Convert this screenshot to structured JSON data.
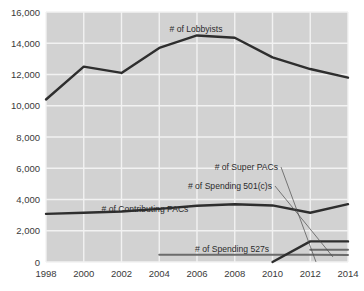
{
  "chart_data": {
    "type": "line",
    "title": "",
    "xlabel": "",
    "ylabel": "",
    "xlim": [
      1998,
      2014
    ],
    "ylim": [
      0,
      16000
    ],
    "grid": true,
    "legend_position": "inline-annotations",
    "x": [
      1998,
      2000,
      2002,
      2004,
      2006,
      2008,
      2010,
      2012,
      2014
    ],
    "x_tick_labels": [
      "1998",
      "2000",
      "2002",
      "2004",
      "2006",
      "2008",
      "2010",
      "2012",
      "2014"
    ],
    "y_ticks": [
      0,
      2000,
      4000,
      6000,
      8000,
      10000,
      12000,
      14000,
      16000
    ],
    "y_tick_labels": [
      "0",
      "2,000",
      "4,000",
      "6,000",
      "8,000",
      "10,000",
      "12,000",
      "14,000",
      "16,000"
    ],
    "series": [
      {
        "name": "# of Lobbyists",
        "color": "#2e2e2e",
        "x": [
          1998,
          2000,
          2002,
          2004,
          2006,
          2008,
          2010,
          2012,
          2014
        ],
        "values": [
          10400,
          12500,
          12100,
          13700,
          14500,
          14350,
          13100,
          12350,
          11800
        ]
      },
      {
        "name": "# of Contributing PACs",
        "color": "#2e2e2e",
        "x": [
          1998,
          2000,
          2002,
          2004,
          2006,
          2008,
          2010,
          2012,
          2014
        ],
        "values": [
          3080,
          3150,
          3230,
          3400,
          3600,
          3700,
          3620,
          3150,
          3700
        ]
      },
      {
        "name": "# of Spending 527s",
        "color": "#6b6b6b",
        "x": [
          2004,
          2006,
          2008,
          2010,
          2012,
          2014
        ],
        "values": [
          470,
          470,
          470,
          470,
          470,
          450
        ]
      },
      {
        "name": "# of Super PACs",
        "color": "#4a4a4a",
        "x": [
          2010,
          2012,
          2014
        ],
        "values": [
          0,
          1320,
          1320
        ]
      },
      {
        "name": "# of Spending 501(c)s",
        "color": "#6b6b6b",
        "x": [
          2012,
          2014
        ],
        "values": [
          790,
          790
        ]
      }
    ],
    "annotations": [
      {
        "id": "lobbyists",
        "text": "# of Lobbyists"
      },
      {
        "id": "contributing_pacs",
        "text": "# of Contributing PACs"
      },
      {
        "id": "super_pacs",
        "text": "# of Super PACs"
      },
      {
        "id": "spending_501c",
        "text": "# of Spending 501(c)s"
      },
      {
        "id": "spending_527",
        "text": "# of Spending 527s"
      }
    ]
  }
}
